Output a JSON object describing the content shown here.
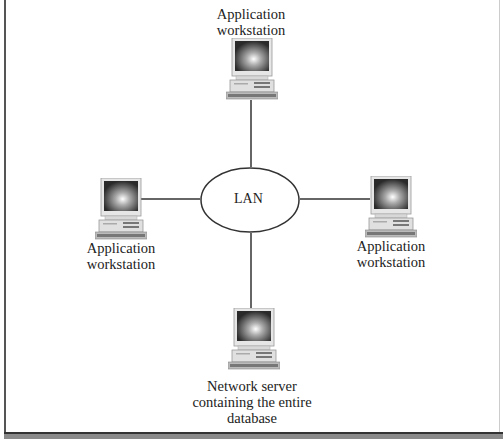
{
  "diagram": {
    "hub": {
      "label": "LAN",
      "shape": "ellipse"
    },
    "nodes": [
      {
        "id": "top",
        "label_line1": "Application",
        "label_line2": "workstation",
        "icon": "desktop-computer-icon"
      },
      {
        "id": "left",
        "label_line1": "Application",
        "label_line2": "workstation",
        "icon": "desktop-computer-icon"
      },
      {
        "id": "right",
        "label_line1": "Application",
        "label_line2": "workstation",
        "icon": "desktop-computer-icon"
      },
      {
        "id": "bottom",
        "label_line1": "Network server",
        "label_line2": "containing the entire",
        "label_line3": "database",
        "icon": "desktop-computer-icon"
      }
    ],
    "edges": [
      [
        "top",
        "LAN"
      ],
      [
        "left",
        "LAN"
      ],
      [
        "right",
        "LAN"
      ],
      [
        "bottom",
        "LAN"
      ]
    ]
  },
  "colors": {
    "line": "#333333",
    "frame": "#555555",
    "bottom_bar": "#8a8a8a"
  }
}
